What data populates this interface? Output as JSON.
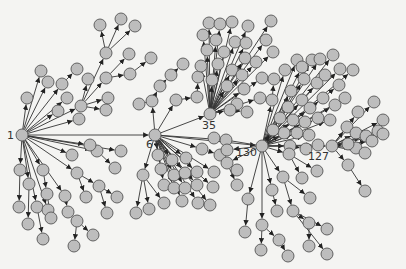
{
  "diagram": {
    "type": "directed-tree-network",
    "colors": {
      "background": "#f4f4f2",
      "node_fill": "#bdbdbd",
      "node_stroke": "#555555",
      "edge": "#333333",
      "label": "#333333"
    },
    "node_radius": 6,
    "hubs": [
      {
        "id": "1",
        "label": "1",
        "x": 22,
        "y": 135,
        "label_dx": -15,
        "label_dy": 4
      },
      {
        "id": "6",
        "label": "6",
        "x": 155,
        "y": 135,
        "label_dx": -9,
        "label_dy": 13
      },
      {
        "id": "35",
        "label": "35",
        "x": 210,
        "y": 114,
        "label_dx": -8,
        "label_dy": 15
      },
      {
        "id": "130",
        "label": "130",
        "x": 262,
        "y": 146,
        "label_dx": -26,
        "label_dy": 10
      },
      {
        "id": "127",
        "label": "127",
        "x": 332,
        "y": 146,
        "label_dx": -24,
        "label_dy": 14
      }
    ],
    "hub_edges": [
      [
        "1",
        "6"
      ],
      [
        "6",
        "35"
      ],
      [
        "6",
        "130"
      ],
      [
        "130",
        "127"
      ]
    ],
    "nodes": [
      {
        "id": "a1",
        "x": 27,
        "y": 98,
        "p": "1"
      },
      {
        "id": "a2",
        "x": 41,
        "y": 71,
        "p": "1"
      },
      {
        "id": "a3",
        "x": 48,
        "y": 82,
        "p": "1"
      },
      {
        "id": "a4",
        "x": 62,
        "y": 84,
        "p": "1"
      },
      {
        "id": "a5",
        "x": 77,
        "y": 69,
        "p": "a4"
      },
      {
        "id": "a6",
        "x": 67,
        "y": 98,
        "p": "1"
      },
      {
        "id": "a7",
        "x": 58,
        "y": 111,
        "p": "1"
      },
      {
        "id": "a8",
        "x": 81,
        "y": 106,
        "p": "1"
      },
      {
        "id": "a9",
        "x": 88,
        "y": 79,
        "p": "a8"
      },
      {
        "id": "a10",
        "x": 106,
        "y": 78,
        "p": "a8"
      },
      {
        "id": "a11",
        "x": 108,
        "y": 98,
        "p": "a8"
      },
      {
        "id": "a12",
        "x": 106,
        "y": 110,
        "p": "a8"
      },
      {
        "id": "a13",
        "x": 79,
        "y": 119,
        "p": "1"
      },
      {
        "id": "b1",
        "x": 106,
        "y": 53,
        "p": "a8"
      },
      {
        "id": "b2",
        "x": 100,
        "y": 25,
        "p": "b1"
      },
      {
        "id": "b3",
        "x": 121,
        "y": 19,
        "p": "b1"
      },
      {
        "id": "b4",
        "x": 135,
        "y": 26,
        "p": "b1"
      },
      {
        "id": "b5",
        "x": 129,
        "y": 54,
        "p": "a10"
      },
      {
        "id": "b6",
        "x": 130,
        "y": 74,
        "p": "a10"
      },
      {
        "id": "b7",
        "x": 151,
        "y": 58,
        "p": "b6"
      },
      {
        "id": "c1",
        "x": 20,
        "y": 170,
        "p": "1"
      },
      {
        "id": "c2",
        "x": 19,
        "y": 207,
        "p": "c1"
      },
      {
        "id": "c3",
        "x": 29,
        "y": 184,
        "p": "1"
      },
      {
        "id": "c4",
        "x": 28,
        "y": 224,
        "p": "c3"
      },
      {
        "id": "c5",
        "x": 37,
        "y": 207,
        "p": "1"
      },
      {
        "id": "c6",
        "x": 43,
        "y": 170,
        "p": "1"
      },
      {
        "id": "c7",
        "x": 48,
        "y": 210,
        "p": "1"
      },
      {
        "id": "c8",
        "x": 43,
        "y": 239,
        "p": "c5"
      },
      {
        "id": "c9",
        "x": 47,
        "y": 194,
        "p": "c6"
      },
      {
        "id": "c10",
        "x": 51,
        "y": 218,
        "p": "c9"
      },
      {
        "id": "c11",
        "x": 65,
        "y": 196,
        "p": "1"
      },
      {
        "id": "c12",
        "x": 68,
        "y": 212,
        "p": "c11"
      },
      {
        "id": "c13",
        "x": 77,
        "y": 221,
        "p": "c12"
      },
      {
        "id": "c14",
        "x": 74,
        "y": 246,
        "p": "c13"
      },
      {
        "id": "c15",
        "x": 93,
        "y": 235,
        "p": "c13"
      },
      {
        "id": "c16",
        "x": 77,
        "y": 173,
        "p": "1"
      },
      {
        "id": "c17",
        "x": 86,
        "y": 197,
        "p": "c16"
      },
      {
        "id": "c18",
        "x": 99,
        "y": 186,
        "p": "c16"
      },
      {
        "id": "c19",
        "x": 107,
        "y": 213,
        "p": "c18"
      },
      {
        "id": "c20",
        "x": 117,
        "y": 197,
        "p": "c18"
      },
      {
        "id": "c21",
        "x": 97,
        "y": 151,
        "p": "1"
      },
      {
        "id": "c22",
        "x": 115,
        "y": 168,
        "p": "c21"
      },
      {
        "id": "c23",
        "x": 72,
        "y": 155,
        "p": "1"
      },
      {
        "id": "c24",
        "x": 90,
        "y": 145,
        "p": "1"
      },
      {
        "id": "c25",
        "x": 121,
        "y": 151,
        "p": "1"
      },
      {
        "id": "d1",
        "x": 143,
        "y": 175,
        "p": "6"
      },
      {
        "id": "d2",
        "x": 136,
        "y": 213,
        "p": "d1"
      },
      {
        "id": "d3",
        "x": 149,
        "y": 209,
        "p": "d1"
      },
      {
        "id": "d4",
        "x": 164,
        "y": 203,
        "p": "d1"
      },
      {
        "id": "d5",
        "x": 158,
        "y": 155,
        "p": "6"
      },
      {
        "id": "d6",
        "x": 172,
        "y": 160,
        "p": "6"
      },
      {
        "id": "d7",
        "x": 186,
        "y": 158,
        "p": "6"
      },
      {
        "id": "d8",
        "x": 161,
        "y": 169,
        "p": "6"
      },
      {
        "id": "d9",
        "x": 174,
        "y": 175,
        "p": "6"
      },
      {
        "id": "d10",
        "x": 185,
        "y": 173,
        "p": "6"
      },
      {
        "id": "d11",
        "x": 197,
        "y": 172,
        "p": "6"
      },
      {
        "id": "d12",
        "x": 214,
        "y": 172,
        "p": "6"
      },
      {
        "id": "d13",
        "x": 164,
        "y": 185,
        "p": "6"
      },
      {
        "id": "d14",
        "x": 174,
        "y": 188,
        "p": "6"
      },
      {
        "id": "d15",
        "x": 185,
        "y": 188,
        "p": "6"
      },
      {
        "id": "d16",
        "x": 197,
        "y": 185,
        "p": "6"
      },
      {
        "id": "d17",
        "x": 213,
        "y": 187,
        "p": "6"
      },
      {
        "id": "d18",
        "x": 182,
        "y": 201,
        "p": "6"
      },
      {
        "id": "d19",
        "x": 198,
        "y": 203,
        "p": "6"
      },
      {
        "id": "d20",
        "x": 210,
        "y": 205,
        "p": "6"
      },
      {
        "id": "d21",
        "x": 202,
        "y": 149,
        "p": "6"
      },
      {
        "id": "d22",
        "x": 220,
        "y": 155,
        "p": "d21"
      },
      {
        "id": "d23",
        "x": 226,
        "y": 140,
        "p": "6"
      },
      {
        "id": "e1",
        "x": 152,
        "y": 101,
        "p": "6"
      },
      {
        "id": "e2",
        "x": 139,
        "y": 104,
        "p": "e1"
      },
      {
        "id": "e3",
        "x": 160,
        "y": 86,
        "p": "e1"
      },
      {
        "id": "e4",
        "x": 171,
        "y": 75,
        "p": "e3"
      },
      {
        "id": "e5",
        "x": 183,
        "y": 64,
        "p": "e4"
      },
      {
        "id": "e6",
        "x": 176,
        "y": 100,
        "p": "6"
      },
      {
        "id": "e7",
        "x": 197,
        "y": 97,
        "p": "e6"
      },
      {
        "id": "e8",
        "x": 198,
        "y": 77,
        "p": "e7"
      },
      {
        "id": "f1",
        "x": 209,
        "y": 23,
        "p": "35"
      },
      {
        "id": "f2",
        "x": 220,
        "y": 24,
        "p": "35"
      },
      {
        "id": "f3",
        "x": 232,
        "y": 22,
        "p": "35"
      },
      {
        "id": "f4",
        "x": 248,
        "y": 26,
        "p": "35"
      },
      {
        "id": "f5",
        "x": 271,
        "y": 21,
        "p": "35"
      },
      {
        "id": "f6",
        "x": 203,
        "y": 35,
        "p": "35"
      },
      {
        "id": "f7",
        "x": 216,
        "y": 40,
        "p": "35"
      },
      {
        "id": "f8",
        "x": 235,
        "y": 42,
        "p": "35"
      },
      {
        "id": "f9",
        "x": 246,
        "y": 43,
        "p": "35"
      },
      {
        "id": "f10",
        "x": 266,
        "y": 40,
        "p": "35"
      },
      {
        "id": "f11",
        "x": 207,
        "y": 50,
        "p": "35"
      },
      {
        "id": "f12",
        "x": 224,
        "y": 52,
        "p": "35"
      },
      {
        "id": "f13",
        "x": 245,
        "y": 58,
        "p": "35"
      },
      {
        "id": "f14",
        "x": 256,
        "y": 62,
        "p": "35"
      },
      {
        "id": "f15",
        "x": 273,
        "y": 52,
        "p": "35"
      },
      {
        "id": "f16",
        "x": 201,
        "y": 66,
        "p": "35"
      },
      {
        "id": "f17",
        "x": 218,
        "y": 64,
        "p": "35"
      },
      {
        "id": "f18",
        "x": 232,
        "y": 70,
        "p": "35"
      },
      {
        "id": "f19",
        "x": 242,
        "y": 75,
        "p": "35"
      },
      {
        "id": "f20",
        "x": 262,
        "y": 78,
        "p": "35"
      },
      {
        "id": "f21",
        "x": 212,
        "y": 80,
        "p": "35"
      },
      {
        "id": "f22",
        "x": 227,
        "y": 86,
        "p": "35"
      },
      {
        "id": "f23",
        "x": 244,
        "y": 89,
        "p": "35"
      },
      {
        "id": "f24",
        "x": 260,
        "y": 98,
        "p": "35"
      },
      {
        "id": "f25",
        "x": 237,
        "y": 104,
        "p": "35"
      },
      {
        "id": "f26",
        "x": 230,
        "y": 110,
        "p": "35"
      },
      {
        "id": "f27",
        "x": 247,
        "y": 112,
        "p": "f26"
      },
      {
        "id": "g1",
        "x": 272,
        "y": 100,
        "p": "130"
      },
      {
        "id": "g2",
        "x": 274,
        "y": 79,
        "p": "g1"
      },
      {
        "id": "g3",
        "x": 285,
        "y": 70,
        "p": "130"
      },
      {
        "id": "g4",
        "x": 291,
        "y": 91,
        "p": "130"
      },
      {
        "id": "g5",
        "x": 297,
        "y": 60,
        "p": "130"
      },
      {
        "id": "g6",
        "x": 302,
        "y": 67,
        "p": "130"
      },
      {
        "id": "g7",
        "x": 312,
        "y": 60,
        "p": "130"
      },
      {
        "id": "g8",
        "x": 320,
        "y": 59,
        "p": "130"
      },
      {
        "id": "g9",
        "x": 333,
        "y": 55,
        "p": "130"
      },
      {
        "id": "g10",
        "x": 340,
        "y": 69,
        "p": "130"
      },
      {
        "id": "g11",
        "x": 304,
        "y": 79,
        "p": "130"
      },
      {
        "id": "g12",
        "x": 317,
        "y": 83,
        "p": "130"
      },
      {
        "id": "g13",
        "x": 325,
        "y": 75,
        "p": "130"
      },
      {
        "id": "g14",
        "x": 339,
        "y": 85,
        "p": "130"
      },
      {
        "id": "g15",
        "x": 353,
        "y": 70,
        "p": "130"
      },
      {
        "id": "g16",
        "x": 288,
        "y": 107,
        "p": "130"
      },
      {
        "id": "g17",
        "x": 302,
        "y": 100,
        "p": "130"
      },
      {
        "id": "g18",
        "x": 310,
        "y": 108,
        "p": "130"
      },
      {
        "id": "g19",
        "x": 323,
        "y": 98,
        "p": "130"
      },
      {
        "id": "g20",
        "x": 335,
        "y": 105,
        "p": "130"
      },
      {
        "id": "g21",
        "x": 280,
        "y": 118,
        "p": "130"
      },
      {
        "id": "g22",
        "x": 293,
        "y": 120,
        "p": "130"
      },
      {
        "id": "g23",
        "x": 305,
        "y": 122,
        "p": "130"
      },
      {
        "id": "g24",
        "x": 318,
        "y": 118,
        "p": "130"
      },
      {
        "id": "g25",
        "x": 330,
        "y": 120,
        "p": "130"
      },
      {
        "id": "g26",
        "x": 284,
        "y": 133,
        "p": "130"
      },
      {
        "id": "g27",
        "x": 297,
        "y": 133,
        "p": "130"
      },
      {
        "id": "g28",
        "x": 309,
        "y": 135,
        "p": "130"
      },
      {
        "id": "g29",
        "x": 273,
        "y": 130,
        "p": "130"
      },
      {
        "id": "g30",
        "x": 345,
        "y": 98,
        "p": "130"
      },
      {
        "id": "g31",
        "x": 290,
        "y": 146,
        "p": "130"
      },
      {
        "id": "g32",
        "x": 306,
        "y": 149,
        "p": "g31"
      },
      {
        "id": "g33",
        "x": 318,
        "y": 145,
        "p": "130"
      },
      {
        "id": "h1",
        "x": 358,
        "y": 112,
        "p": "127"
      },
      {
        "id": "h2",
        "x": 374,
        "y": 102,
        "p": "127"
      },
      {
        "id": "h3",
        "x": 383,
        "y": 120,
        "p": "127"
      },
      {
        "id": "h4",
        "x": 347,
        "y": 127,
        "p": "127"
      },
      {
        "id": "h5",
        "x": 356,
        "y": 133,
        "p": "127"
      },
      {
        "id": "h6",
        "x": 366,
        "y": 136,
        "p": "127"
      },
      {
        "id": "h7",
        "x": 378,
        "y": 131,
        "p": "127"
      },
      {
        "id": "h8",
        "x": 356,
        "y": 148,
        "p": "127"
      },
      {
        "id": "h9",
        "x": 372,
        "y": 141,
        "p": "127"
      },
      {
        "id": "h10",
        "x": 365,
        "y": 153,
        "p": "127"
      },
      {
        "id": "h11",
        "x": 383,
        "y": 134,
        "p": "127"
      },
      {
        "id": "h12",
        "x": 348,
        "y": 144,
        "p": "127"
      },
      {
        "id": "h13",
        "x": 348,
        "y": 165,
        "p": "127"
      },
      {
        "id": "h14",
        "x": 365,
        "y": 191,
        "p": "h13"
      },
      {
        "id": "i1",
        "x": 289,
        "y": 154,
        "p": "130"
      },
      {
        "id": "i2",
        "x": 317,
        "y": 171,
        "p": "i1"
      },
      {
        "id": "i3",
        "x": 302,
        "y": 178,
        "p": "i1"
      },
      {
        "id": "i4",
        "x": 283,
        "y": 177,
        "p": "130"
      },
      {
        "id": "i5",
        "x": 310,
        "y": 198,
        "p": "i4"
      },
      {
        "id": "i6",
        "x": 293,
        "y": 211,
        "p": "i4"
      },
      {
        "id": "i7",
        "x": 309,
        "y": 223,
        "p": "i6"
      },
      {
        "id": "i8",
        "x": 327,
        "y": 229,
        "p": "i6"
      },
      {
        "id": "i9",
        "x": 327,
        "y": 254,
        "p": "i6"
      },
      {
        "id": "i10",
        "x": 309,
        "y": 246,
        "p": "i7"
      },
      {
        "id": "i11",
        "x": 272,
        "y": 190,
        "p": "130"
      },
      {
        "id": "i12",
        "x": 277,
        "y": 211,
        "p": "i11"
      },
      {
        "id": "i13",
        "x": 248,
        "y": 199,
        "p": "130"
      },
      {
        "id": "i14",
        "x": 245,
        "y": 232,
        "p": "i13"
      },
      {
        "id": "i15",
        "x": 262,
        "y": 225,
        "p": "130"
      },
      {
        "id": "i16",
        "x": 279,
        "y": 240,
        "p": "i15"
      },
      {
        "id": "i17",
        "x": 288,
        "y": 256,
        "p": "i16"
      },
      {
        "id": "i18",
        "x": 261,
        "y": 250,
        "p": "i15"
      },
      {
        "id": "i19",
        "x": 227,
        "y": 150,
        "p": "130"
      },
      {
        "id": "i20",
        "x": 227,
        "y": 163,
        "p": "130"
      },
      {
        "id": "i21",
        "x": 237,
        "y": 170,
        "p": "i20"
      },
      {
        "id": "i22",
        "x": 237,
        "y": 185,
        "p": "i20"
      },
      {
        "id": "i23",
        "x": 214,
        "y": 138,
        "p": "130"
      }
    ]
  }
}
